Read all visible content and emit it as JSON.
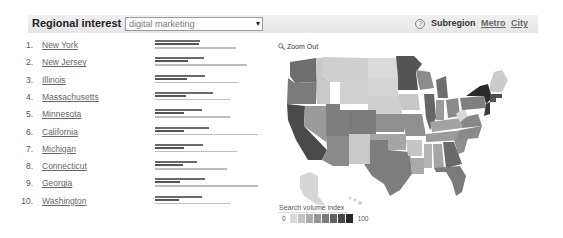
{
  "header": {
    "title": "Regional interest",
    "search_value": "digital marketing",
    "dropdown_arrow": "▾",
    "help_icon": "?",
    "subregion_label": "Subregion",
    "links": [
      "Metro",
      "City"
    ]
  },
  "map": {
    "zoom_out_label": "Zoom Out",
    "legend_title": "Search volume index",
    "legend_min": "0",
    "legend_max": "100",
    "legend_colors": [
      "#d9d9d9",
      "#c4c4c4",
      "#ababab",
      "#939393",
      "#7b7b7b",
      "#626262",
      "#494949",
      "#2a2a2a"
    ]
  },
  "chart_data": {
    "type": "bar",
    "title": "Regional interest",
    "query": "digital marketing",
    "categories": [
      "New York",
      "New Jersey",
      "Illinois",
      "Massachusetts",
      "Minnesota",
      "California",
      "Michigan",
      "Connecticut",
      "Georgia",
      "Washington"
    ],
    "series": [
      {
        "name": "bar_1",
        "values": [
          44,
          48,
          49,
          56,
          46,
          52,
          47,
          41,
          49,
          46
        ]
      },
      {
        "name": "bar_2",
        "values": [
          43,
          32,
          31,
          30,
          28,
          28,
          28,
          27,
          24,
          23
        ]
      },
      {
        "name": "bar_3",
        "values": [
          79,
          89,
          81,
          73,
          73,
          100,
          80,
          70,
          100,
          73
        ]
      }
    ],
    "xlabel": "",
    "ylabel": "",
    "legend": {
      "title": "Search volume index",
      "min": 0,
      "max": 100
    }
  },
  "rows": [
    {
      "rank": "1.",
      "name": "New York",
      "b1": 44,
      "b2": 43,
      "b3": 79
    },
    {
      "rank": "2.",
      "name": "New Jersey",
      "b1": 48,
      "b2": 32,
      "b3": 89
    },
    {
      "rank": "3.",
      "name": "Illinois",
      "b1": 49,
      "b2": 31,
      "b3": 81
    },
    {
      "rank": "4.",
      "name": "Massachusetts",
      "b1": 56,
      "b2": 30,
      "b3": 73
    },
    {
      "rank": "5.",
      "name": "Minnesota",
      "b1": 46,
      "b2": 28,
      "b3": 73
    },
    {
      "rank": "6.",
      "name": "California",
      "b1": 52,
      "b2": 28,
      "b3": 100
    },
    {
      "rank": "7.",
      "name": "Michigan",
      "b1": 47,
      "b2": 28,
      "b3": 80
    },
    {
      "rank": "8.",
      "name": "Connecticut",
      "b1": 41,
      "b2": 27,
      "b3": 70
    },
    {
      "rank": "9.",
      "name": "Georgia",
      "b1": 49,
      "b2": 24,
      "b3": 100
    },
    {
      "rank": "10.",
      "name": "Washington",
      "b1": 46,
      "b2": 23,
      "b3": 73
    }
  ]
}
